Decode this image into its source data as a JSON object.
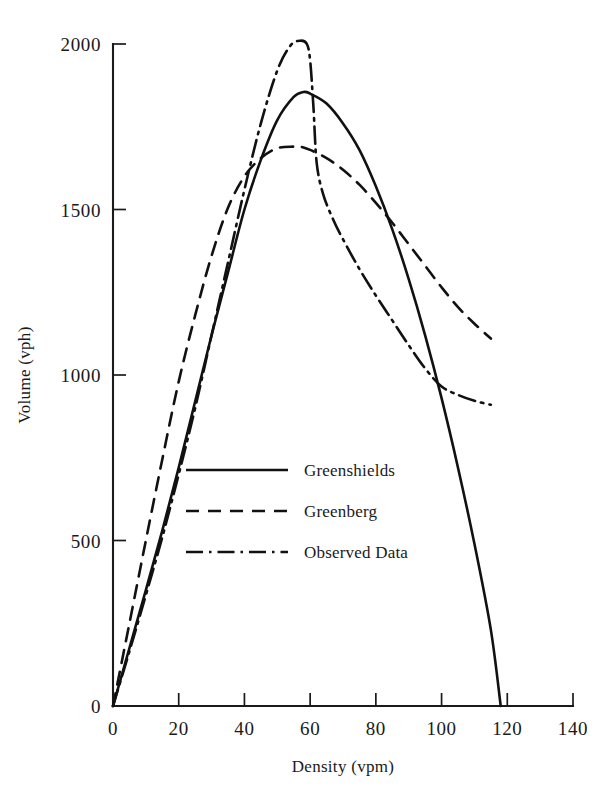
{
  "chart_data": {
    "type": "line",
    "title": "",
    "subtitle": "",
    "xlabel": "Density (vpm)",
    "ylabel": "Volume (vph)",
    "xlim": [
      0,
      140
    ],
    "ylim": [
      0,
      2000
    ],
    "xticks": [
      0,
      20,
      40,
      60,
      80,
      100,
      120,
      140
    ],
    "xtick_labels": [
      "0",
      "20",
      "40",
      "60",
      "80",
      "100",
      "120",
      "140"
    ],
    "yticks": [
      0,
      500,
      1000,
      1500,
      2000
    ],
    "ytick_labels": [
      "0",
      "500",
      "1000",
      "1500",
      "2000"
    ],
    "grid": false,
    "legend_position": "center-left",
    "series": [
      {
        "name": "Greenshields",
        "style": "solid",
        "color": "#111111",
        "x": [
          0,
          5,
          10,
          15,
          20,
          25,
          30,
          35,
          40,
          45,
          50,
          55,
          58,
          60,
          65,
          70,
          75,
          80,
          85,
          90,
          95,
          100,
          105,
          110,
          115,
          118
        ],
        "y": [
          0,
          175,
          350,
          530,
          720,
          920,
          1120,
          1310,
          1500,
          1650,
          1770,
          1840,
          1855,
          1850,
          1820,
          1760,
          1680,
          1570,
          1440,
          1290,
          1120,
          930,
          720,
          490,
          230,
          0
        ]
      },
      {
        "name": "Greenberg",
        "style": "dashed",
        "color": "#111111",
        "x": [
          0,
          5,
          10,
          15,
          20,
          25,
          30,
          35,
          40,
          45,
          50,
          55,
          57,
          60,
          65,
          70,
          75,
          80,
          85,
          90,
          95,
          100,
          105,
          110,
          115
        ],
        "y": [
          0,
          250,
          500,
          745,
          980,
          1180,
          1360,
          1505,
          1600,
          1655,
          1685,
          1690,
          1690,
          1680,
          1655,
          1620,
          1575,
          1520,
          1460,
          1395,
          1330,
          1265,
          1205,
          1155,
          1110
        ]
      },
      {
        "name": "Observed Data",
        "style": "dashdot",
        "color": "#111111",
        "x": [
          0,
          5,
          10,
          15,
          20,
          25,
          30,
          35,
          40,
          45,
          50,
          54,
          57,
          59,
          60,
          61,
          62,
          64,
          67,
          70,
          75,
          80,
          85,
          90,
          95,
          100,
          105,
          110,
          115
        ],
        "y": [
          0,
          165,
          335,
          510,
          700,
          900,
          1120,
          1340,
          1560,
          1760,
          1920,
          1995,
          2010,
          2000,
          1950,
          1810,
          1640,
          1545,
          1470,
          1410,
          1320,
          1240,
          1165,
          1090,
          1020,
          965,
          940,
          922,
          910
        ]
      }
    ],
    "legend_entries": [
      {
        "label": "Greenshields",
        "style": "solid"
      },
      {
        "label": "Greenberg",
        "style": "dashed"
      },
      {
        "label": "Observed Data",
        "style": "dashdot"
      }
    ]
  }
}
